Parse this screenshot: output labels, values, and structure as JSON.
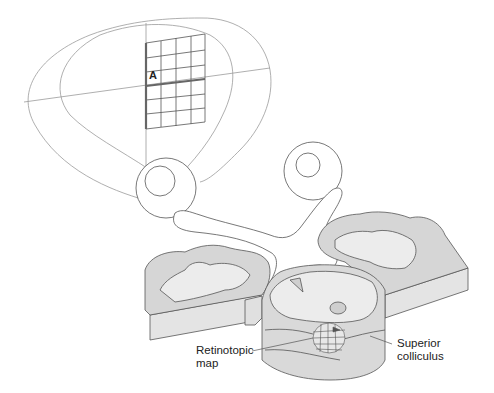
{
  "diagram": {
    "labels": {
      "grid_point": "A",
      "retinotopic_map": [
        "Retinotopic",
        "map"
      ],
      "superior_colliculus": [
        "Superior",
        "colliculus"
      ]
    },
    "colors": {
      "outline": "#888888",
      "line": "#444444",
      "tissue_light": "#ececec",
      "tissue_mid": "#d9d9d9",
      "tissue_dark": "#c8c8c8",
      "grid_highlight": "#666666"
    }
  }
}
